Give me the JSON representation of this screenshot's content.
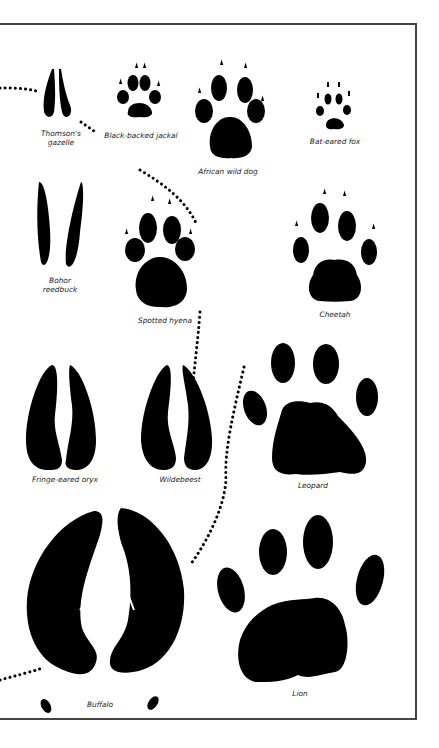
{
  "page": {
    "header_text": "",
    "frame_color": "#444444",
    "ink_color": "#000000"
  },
  "tracks": [
    {
      "id": "thomsons-gazelle",
      "name": "Thomson's\ngazelle",
      "type": "hoof"
    },
    {
      "id": "black-backed-jackal",
      "name": "Black-backed jackal",
      "type": "paw"
    },
    {
      "id": "african-wild-dog",
      "name": "African wild dog",
      "type": "paw"
    },
    {
      "id": "bat-eared-fox",
      "name": "Bat-eared fox",
      "type": "paw"
    },
    {
      "id": "bohor-reedbuck",
      "name": "Bohor\nreedbuck",
      "type": "hoof"
    },
    {
      "id": "spotted-hyena",
      "name": "Spotted hyena",
      "type": "paw"
    },
    {
      "id": "cheetah",
      "name": "Cheetah",
      "type": "paw"
    },
    {
      "id": "fringe-eared-oryx",
      "name": "Fringe-eared oryx",
      "type": "hoof"
    },
    {
      "id": "wildebeest",
      "name": "Wildebeest",
      "type": "hoof"
    },
    {
      "id": "leopard",
      "name": "Leopard",
      "type": "paw"
    },
    {
      "id": "buffalo",
      "name": "Buffalo",
      "type": "hoof"
    },
    {
      "id": "lion",
      "name": "Lion",
      "type": "paw"
    }
  ]
}
